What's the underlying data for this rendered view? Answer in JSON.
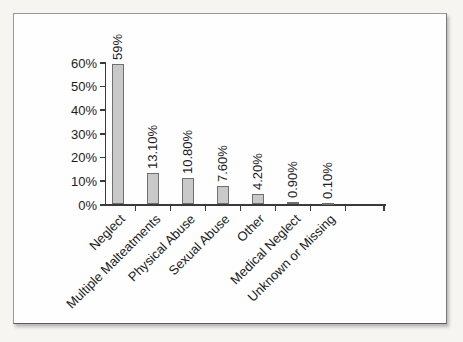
{
  "figure": {
    "background": "#fefefe",
    "frame_border_color": "#9a9a9a",
    "page_background": "#f6f5f1"
  },
  "chart_data": {
    "type": "bar",
    "title": "",
    "xlabel": "",
    "ylabel": "",
    "categories": [
      "Neglect",
      "Multiple Malteatments",
      "Physical Abuse",
      "Sexual Abuse",
      "Other",
      "Medical Neglect",
      "Unknown or Missing"
    ],
    "values": [
      59,
      13.1,
      10.8,
      7.6,
      4.2,
      0.9,
      0.1
    ],
    "value_labels": [
      "59%",
      "13.10%",
      "10.80%",
      "7.60%",
      "4.20%",
      "0.90%",
      "0.10%"
    ],
    "y_tick_labels": [
      "0%",
      "10%",
      "20%",
      "30%",
      "40%",
      "50%",
      "60%"
    ],
    "ylim": [
      0,
      60
    ],
    "grid": false,
    "legend": "none",
    "bar_color": "#c9c9c9",
    "bar_border_color": "#6f6f6f",
    "axis_color": "#3a3a3a",
    "label_rotation_values_deg": -90,
    "label_rotation_categories_deg": -45
  }
}
